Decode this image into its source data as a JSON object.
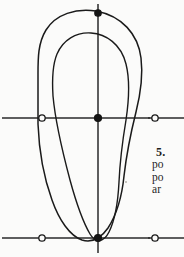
{
  "page": {
    "background_color": "#fbfbfa",
    "ink_color": "#1d1d1d",
    "width": 184,
    "height": 257
  },
  "figure": {
    "name": "nested-loop-curve-diagram",
    "line_color": "#1a1a1a",
    "axis_color": "#2a2a2a",
    "curves": [
      {
        "id": "outer-loop",
        "label": "outer curve",
        "path": "M 96 11 C 76 8 56 14 46 30 C 38 43 38 58 38 74 L 38 118 L 38 124 C 39 150 44 178 52 200 C 59 220 70 236 82 240 C 92 243 101 238 108 228 C 117 214 122 196 124 176 C 127 150 132 128 136 112 C 141 92 143 74 141 58 C 138 34 122 16 96 11 Z"
      },
      {
        "id": "inner-loop",
        "label": "inner curve",
        "path": "M 91 33 C 76 32 63 40 57 54 C 52 66 52 80 53 96 C 55 118 62 150 70 180 C 76 202 83 222 90 234 C 96 244 104 242 109 232 C 115 220 118 202 119 182 C 120 160 123 138 126 120 C 129 100 130 80 126 64 C 121 44 106 34 91 33 Z"
      }
    ],
    "axes": [
      {
        "id": "vertical-axis",
        "orientation": "vertical",
        "x": 98,
        "y1": 4,
        "y2": 253
      },
      {
        "id": "upper-horizontal-axis",
        "orientation": "horizontal",
        "y": 118,
        "x1": 2,
        "x2": 184
      },
      {
        "id": "lower-horizontal-axis",
        "orientation": "horizontal",
        "y": 238,
        "x1": 2,
        "x2": 184
      }
    ],
    "markers": [
      {
        "id": "marker-top-center",
        "x": 98,
        "y": 13,
        "style": "filled",
        "radius": 3.2
      },
      {
        "id": "marker-mid-left",
        "x": 42,
        "y": 118,
        "style": "hollow",
        "radius": 3.2
      },
      {
        "id": "marker-mid-center",
        "x": 98,
        "y": 118,
        "style": "filled",
        "radius": 3.4
      },
      {
        "id": "marker-mid-right",
        "x": 155,
        "y": 118,
        "style": "hollow",
        "radius": 3.2
      },
      {
        "id": "marker-bottom-left",
        "x": 42,
        "y": 238,
        "style": "hollow",
        "radius": 3.2
      },
      {
        "id": "marker-bottom-center",
        "x": 98,
        "y": 238,
        "style": "filled",
        "radius": 3.4
      },
      {
        "id": "marker-bottom-right",
        "x": 155,
        "y": 238,
        "style": "hollow",
        "radius": 3.2
      }
    ]
  },
  "text_column": {
    "note": "body text is cropped by the right page edge; only the leading characters are visible",
    "lines": [
      {
        "id": "line-heading",
        "text": "5.",
        "style": "heading"
      },
      {
        "id": "line-1",
        "text": "po",
        "style": "body"
      },
      {
        "id": "line-2",
        "text": "po",
        "style": "body"
      },
      {
        "id": "line-3",
        "text": "ar",
        "style": "body"
      }
    ]
  }
}
